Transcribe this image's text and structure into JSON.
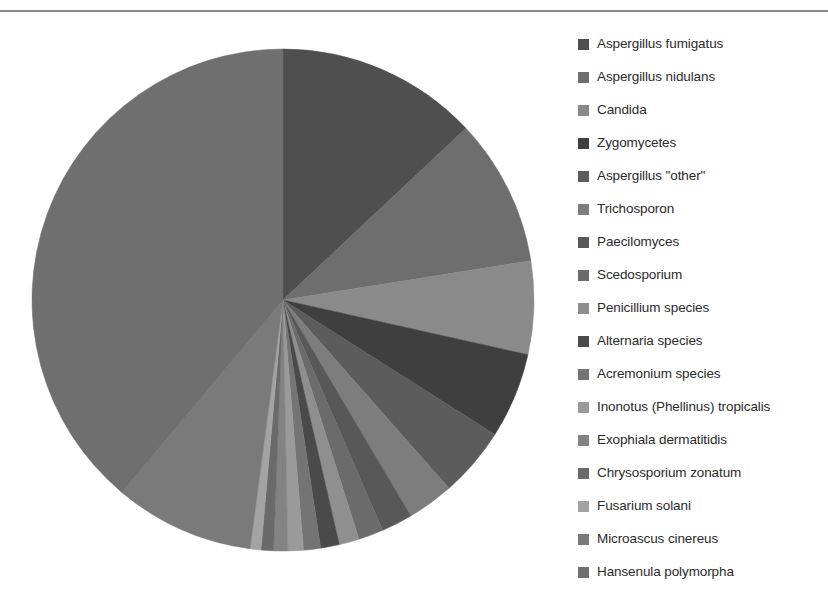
{
  "chart_data": {
    "type": "pie",
    "title": "",
    "legend_position": "right",
    "start_angle_deg": -90,
    "direction": "clockwise",
    "center": {
      "x": 283,
      "y": 300
    },
    "radius": 251,
    "categories": [
      "Aspergillus fumigatus",
      "Aspergillus nidulans",
      "Candida",
      "Zygomycetes",
      "Aspergillus \"other\"",
      "Trichosporon",
      "Paecilomyces",
      "Scedosporium",
      "Penicillium species",
      "Alternaria species",
      "Acremonium species",
      "Inonotus (Phellinus) tropicalis",
      "Exophiala dermatitidis",
      "Chrysosporium zonatum",
      "Fusarium solani",
      "Microascus cinereus",
      "Hansenula polymorpha"
    ],
    "values": [
      13.0,
      9.5,
      6.0,
      5.5,
      4.5,
      3.0,
      2.0,
      1.6,
      1.3,
      1.2,
      1.1,
      1.0,
      0.9,
      0.8,
      0.7,
      9.0,
      38.9
    ],
    "colors": [
      "#4f4f4f",
      "#6e6e6e",
      "#8a8a8a",
      "#3f3f3f",
      "#5c5c5c",
      "#7d7d7d",
      "#585858",
      "#6b6b6b",
      "#8f8f8f",
      "#4a4a4a",
      "#747474",
      "#9a9a9a",
      "#838383",
      "#6a6a6a",
      "#a3a3a3",
      "#7a7a7a",
      "#6f6f6f"
    ]
  },
  "legend": {
    "items": [
      {
        "label": "Aspergillus fumigatus",
        "color": "#4f4f4f"
      },
      {
        "label": "Aspergillus nidulans",
        "color": "#6e6e6e"
      },
      {
        "label": "Candida",
        "color": "#8a8a8a"
      },
      {
        "label": "Zygomycetes",
        "color": "#3f3f3f"
      },
      {
        "label": "Aspergillus \"other\"",
        "color": "#5c5c5c"
      },
      {
        "label": "Trichosporon",
        "color": "#7d7d7d"
      },
      {
        "label": "Paecilomyces",
        "color": "#585858"
      },
      {
        "label": "Scedosporium",
        "color": "#6b6b6b"
      },
      {
        "label": "Penicillium species",
        "color": "#8f8f8f"
      },
      {
        "label": "Alternaria species",
        "color": "#4a4a4a"
      },
      {
        "label": "Acremonium species",
        "color": "#747474"
      },
      {
        "label": "Inonotus (Phellinus) tropicalis",
        "color": "#9a9a9a"
      },
      {
        "label": "Exophiala dermatitidis",
        "color": "#838383"
      },
      {
        "label": "Chrysosporium zonatum",
        "color": "#6a6a6a"
      },
      {
        "label": "Fusarium solani",
        "color": "#a3a3a3"
      },
      {
        "label": "Microascus cinereus",
        "color": "#7a7a7a"
      },
      {
        "label": "Hansenula polymorpha",
        "color": "#6f6f6f"
      }
    ]
  }
}
